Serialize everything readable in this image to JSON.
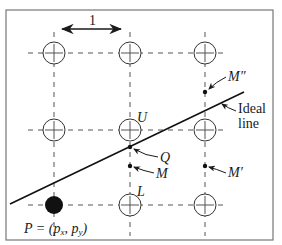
{
  "figure": {
    "frame": {
      "x": 6,
      "y": 10,
      "width": 267,
      "height": 230,
      "stroke": "#777777"
    },
    "grid": {
      "columns_x": [
        54,
        130,
        205
      ],
      "rows_y": [
        53,
        130,
        205
      ],
      "line_color": "#555555",
      "circle_radius": 11
    },
    "spacing_label": "1",
    "ideal_line": {
      "x1": 10,
      "y1": 204,
      "x2": 244,
      "y2": 92,
      "label_line1": "Ideal",
      "label_line2": "line"
    },
    "pixel_start": {
      "label_p": "P = (p",
      "sub_x": "x",
      "sep": ", p",
      "sub_y": "y",
      "close": ")"
    },
    "points": [
      {
        "id": "U",
        "label": "U"
      },
      {
        "id": "Q",
        "label": "Q"
      },
      {
        "id": "M",
        "label": "M"
      },
      {
        "id": "L",
        "label": "L"
      },
      {
        "id": "M_prime",
        "label": "M′"
      },
      {
        "id": "M_double_prime",
        "label": "M″"
      }
    ],
    "colors": {
      "ink": "#1a1a1a",
      "dash": "#555555",
      "frame": "#777777"
    }
  }
}
